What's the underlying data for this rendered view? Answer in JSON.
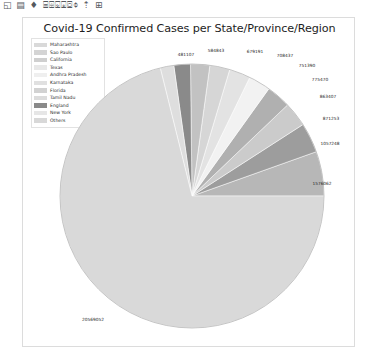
{
  "window": {
    "toolbar_glyphs": "◱ ▤ ♦ ⌸⌹⌺⌻⌼⌽ ⇡ ⊞"
  },
  "figure": {
    "title": "Covid-19 Confirmed Cases per State/Province/Region"
  },
  "legend": {
    "items": [
      {
        "label": "Maharashtra",
        "color": "#d9d9d9"
      },
      {
        "label": "Sao Paulo",
        "color": "#d4d4d4"
      },
      {
        "label": "California",
        "color": "#cfcfcf"
      },
      {
        "label": "Texas",
        "color": "#e8e8e8"
      },
      {
        "label": "Andhra Pradesh",
        "color": "#efefef"
      },
      {
        "label": "Karnataka",
        "color": "#e0e0e0"
      },
      {
        "label": "Florida",
        "color": "#d2d2d2"
      },
      {
        "label": "Tamil Nadu",
        "color": "#dcdcdc"
      },
      {
        "label": "England",
        "color": "#8a8a8a"
      },
      {
        "label": "New York",
        "color": "#e6e6e6"
      },
      {
        "label": "Others",
        "color": "#d8d8d8"
      }
    ]
  },
  "chart_data": {
    "type": "pie",
    "title": "Covid-19 Confirmed Cases per State/Province/Region",
    "legend_position": "upper-left",
    "categories": [
      "Maharashtra",
      "Sao Paulo",
      "California",
      "Texas",
      "Andhra Pradesh",
      "Karnataka",
      "Florida",
      "Tamil Nadu",
      "England",
      "New York",
      "Others"
    ],
    "values": [
      1576062,
      1057248,
      871253,
      863407,
      775470,
      751390,
      708437,
      679191,
      584843,
      481107,
      20569052
    ],
    "labels_shown": [
      "1576062",
      "1057248",
      "871253",
      "863407",
      "775470",
      "751390",
      "708437",
      "679191",
      "584843",
      "481107",
      "20569052"
    ],
    "colors": [
      "#b7b7b7",
      "#9d9d9d",
      "#cbcbcb",
      "#b0b0b0",
      "#f2f2f2",
      "#e3e3e3",
      "#d6d6d6",
      "#c2c2c2",
      "#8a8a8a",
      "#dedede",
      "#d9d9d9"
    ],
    "slice_labels": [
      {
        "text": "481107",
        "x": 163,
        "y": 36
      },
      {
        "text": "584843",
        "x": 193,
        "y": 32
      },
      {
        "text": "679191",
        "x": 232,
        "y": 33
      },
      {
        "text": "708437",
        "x": 262,
        "y": 37
      },
      {
        "text": "751390",
        "x": 284,
        "y": 47
      },
      {
        "text": "775470",
        "x": 297,
        "y": 61
      },
      {
        "text": "863407",
        "x": 305,
        "y": 78
      },
      {
        "text": "871253",
        "x": 308,
        "y": 100
      },
      {
        "text": "1057248",
        "x": 307,
        "y": 125
      },
      {
        "text": "1576062",
        "x": 299,
        "y": 165
      },
      {
        "text": "20569052",
        "x": 70,
        "y": 301
      }
    ]
  }
}
